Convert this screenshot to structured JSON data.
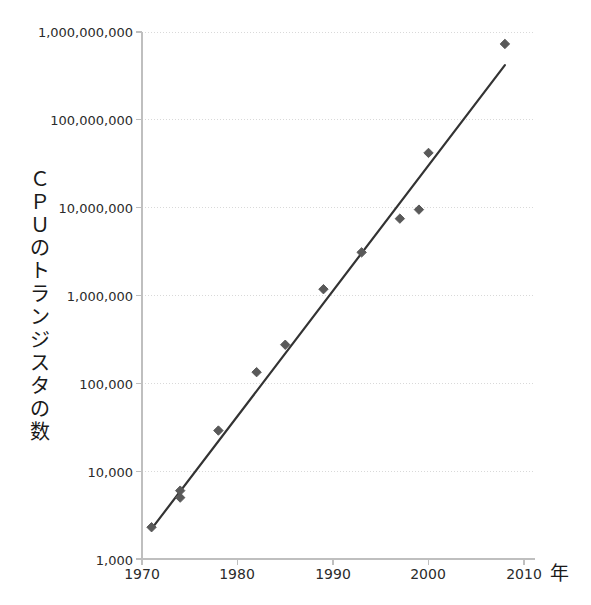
{
  "chart_data": {
    "type": "scatter",
    "title": "",
    "subtitle": "",
    "xlabel": "年",
    "ylabel": "CPUのトランジスタの数",
    "ylabel_chars": "Ｃ\nＰ\nＵ\nの\nト\nラ\nン\nジ\nス\nタ\nの\n数",
    "yscale": "log",
    "xscale": "linear",
    "xlim": [
      1968.5,
      2013.0
    ],
    "ylim": [
      1000,
      1000000000
    ],
    "xticks": [
      1970,
      1980,
      1990,
      2000,
      2010
    ],
    "xtick_labels": [
      "1970",
      "1980",
      "1990",
      "2000",
      "2010"
    ],
    "yticks": [
      1000,
      10000,
      100000,
      1000000,
      10000000,
      100000000,
      1000000000
    ],
    "ytick_labels": [
      "1,000",
      "10,000",
      "100,000",
      "1,000,000",
      "10,000,000",
      "100,000,000",
      "1,000,000,000"
    ],
    "grid": "horizontal",
    "grid_color": "#d9d9d9",
    "axis_color": "#bfbfbf",
    "legend": "none",
    "marker": "diamond",
    "marker_color": "#595959",
    "marker_size": 7,
    "series": [
      {
        "name": "CPUのトランジスタの数",
        "x": [
          1971,
          1974,
          1974,
          1978,
          1982,
          1985,
          1989,
          1993,
          1997,
          1999,
          2000,
          2008
        ],
        "y": [
          2300,
          5000,
          6000,
          29000,
          134000,
          275000,
          1180000,
          3100000,
          7500000,
          9500000,
          42000000,
          731000000
        ]
      }
    ],
    "trendline": {
      "name": "fit",
      "color": "#333333",
      "width": 2.2,
      "x": [
        1971,
        2008
      ],
      "y": [
        2200,
        420000000
      ]
    }
  }
}
